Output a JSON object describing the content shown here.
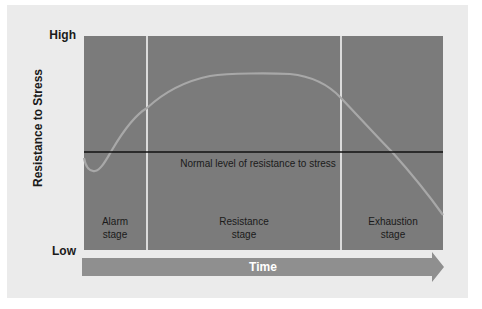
{
  "diagram": {
    "type": "general-adaptation-syndrome",
    "y_axis": {
      "label": "Resistance to Stress",
      "high_label": "High",
      "low_label": "Low"
    },
    "x_axis": {
      "label": "Time"
    },
    "baseline": {
      "label": "Normal level of resistance to stress"
    },
    "stages": [
      {
        "line1": "Alarm",
        "line2": "stage"
      },
      {
        "line1": "Resistance",
        "line2": "stage"
      },
      {
        "line1": "Exhaustion",
        "line2": "stage"
      }
    ],
    "colors": {
      "card": "#ebebeb",
      "plot_fill": "#7b7b7b",
      "curve": "#a8a8a8",
      "divider": "#f4f4f4",
      "baseline": "#111111",
      "time_bar": "#8f8f8f"
    }
  }
}
